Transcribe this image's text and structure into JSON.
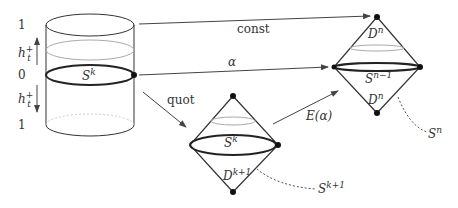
{
  "diagram": {
    "cylinder": {
      "top_label": "1",
      "middle_label": "0",
      "bottom_label": "1",
      "upper_arrow_label": "h",
      "upper_arrow_sub": "t",
      "upper_arrow_sup": "+",
      "lower_arrow_label": "h",
      "lower_arrow_sub": "t",
      "lower_arrow_sup": "+",
      "sphere_label": "S",
      "sphere_sup": "k"
    },
    "arrows": {
      "const": "const",
      "alpha": "α",
      "quot": "quot",
      "extension": "E(α)"
    },
    "right_diamond": {
      "top_disk": "D",
      "top_disk_sup": "n",
      "equator": "S",
      "equator_sup": "n−1",
      "bottom_disk": "D",
      "bottom_disk_sup": "n",
      "sphere": "S",
      "sphere_sup": "n"
    },
    "middle_diamond": {
      "equator": "S",
      "equator_sup": "k",
      "disk": "D",
      "disk_sup": "k+1",
      "sphere": "S",
      "sphere_sup": "k+1"
    },
    "colors": {
      "stroke": "#333333",
      "light_stroke": "#aaaaaa",
      "background": "#ffffff"
    }
  }
}
